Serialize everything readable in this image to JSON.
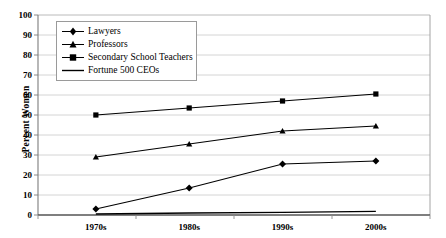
{
  "chart_data": {
    "type": "line",
    "title": "",
    "xlabel": "",
    "ylabel": "Percent Women",
    "categories": [
      "1970s",
      "1980s",
      "1990s",
      "2000s"
    ],
    "ylim": [
      0,
      100
    ],
    "ytick_step": 10,
    "yticks": [
      "0",
      "10",
      "20",
      "30",
      "40",
      "50",
      "60",
      "70",
      "80",
      "90",
      "100"
    ],
    "grid": true,
    "legend_position": "top-left-inside",
    "series": [
      {
        "name": "Lawyers",
        "marker": "diamond",
        "color": "#000000",
        "values": [
          3,
          13.5,
          25.5,
          27
        ]
      },
      {
        "name": "Professors",
        "marker": "triangle",
        "color": "#000000",
        "values": [
          29,
          35.5,
          42,
          44.5
        ]
      },
      {
        "name": "Secondary School Teachers",
        "marker": "square",
        "color": "#000000",
        "values": [
          50,
          53.5,
          57,
          60.5
        ]
      },
      {
        "name": "Fortune 500 CEOs",
        "marker": "none",
        "color": "#000000",
        "values": [
          0.5,
          1,
          1.3,
          1.8
        ]
      }
    ]
  },
  "axis": {
    "y_title": "Percent Women"
  },
  "legend": {
    "items": [
      {
        "label": "Lawyers"
      },
      {
        "label": "Professors"
      },
      {
        "label": "Secondary School Teachers"
      },
      {
        "label": "Fortune 500 CEOs"
      }
    ]
  }
}
